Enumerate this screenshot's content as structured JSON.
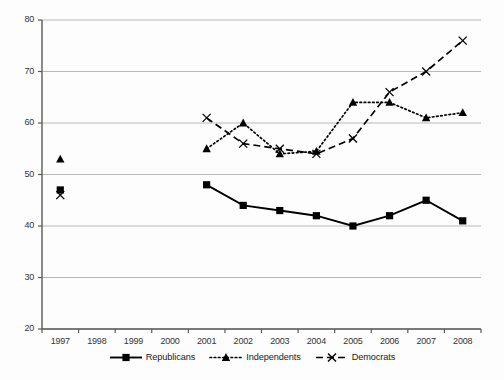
{
  "chart_data": {
    "type": "line",
    "title": "",
    "xlabel": "",
    "ylabel": "",
    "categories": [
      "1997",
      "1998",
      "1999",
      "2000",
      "2001",
      "2002",
      "2003",
      "2004",
      "2005",
      "2006",
      "2007",
      "2008"
    ],
    "ylim": [
      20,
      80
    ],
    "yticks": [
      20,
      30,
      40,
      50,
      60,
      70,
      80
    ],
    "grid": "horizontal",
    "legend_position": "bottom",
    "series": [
      {
        "name": "Republicans",
        "marker": "square",
        "line_style": "solid",
        "color": "#000000",
        "values": [
          47,
          null,
          null,
          null,
          48,
          44,
          43,
          42,
          40,
          42,
          45,
          41
        ]
      },
      {
        "name": "Independents",
        "marker": "triangle",
        "line_style": "dotted",
        "color": "#000000",
        "values": [
          53,
          null,
          null,
          null,
          55,
          60,
          54,
          54.5,
          64,
          64,
          61,
          62
        ]
      },
      {
        "name": "Democrats",
        "marker": "x",
        "line_style": "dashed",
        "color": "#000000",
        "values": [
          46,
          null,
          null,
          null,
          61,
          56,
          55,
          54,
          57,
          66,
          70,
          76
        ]
      }
    ]
  },
  "axes": {
    "ytick_labels": [
      "80",
      "70",
      "60",
      "50",
      "40",
      "30",
      "20"
    ],
    "xtick_labels": [
      "1997",
      "1998",
      "1999",
      "2000",
      "2001",
      "2002",
      "2003",
      "2004",
      "2005",
      "2006",
      "2007",
      "2008"
    ]
  },
  "legend": {
    "entries": [
      {
        "label": "Republicans"
      },
      {
        "label": "Independents"
      },
      {
        "label": "Democrats"
      }
    ]
  }
}
